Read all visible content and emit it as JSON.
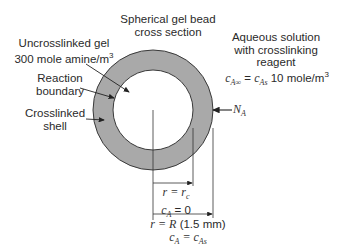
{
  "diagram": {
    "title_line1": "Spherical gel bead",
    "title_line2": "cross section",
    "left_labels": {
      "uncrosslinked_line1": "Uncrosslinked gel",
      "uncrosslinked_line2": "300 mole amine/m",
      "uncrosslinked_sup": "3",
      "reaction_line1": "Reaction",
      "reaction_line2": "boundary",
      "crosslinked_line1": "Crosslinked",
      "crosslinked_line2": "shell"
    },
    "right_labels": {
      "solution_line1": "Aqueous solution",
      "solution_line2": "with crosslinking",
      "solution_line3": "reagent",
      "conc_lhs": "c",
      "conc_lhs_sub": "A∞",
      "conc_eq": " = ",
      "conc_mid": "c",
      "conc_mid_sub": "As",
      "conc_value": " 10 mole/m",
      "conc_sup": "3",
      "flux": "N",
      "flux_sub": "A"
    },
    "bottom_labels": {
      "inner_r": "r = r",
      "inner_r_sub": "c",
      "inner_c": "c",
      "inner_c_sub": "A",
      "inner_c_val": " = 0",
      "outer_r": "r = ",
      "outer_R": "R",
      "outer_R_value": " (1.5 mm)",
      "outer_c": "c",
      "outer_c_sub": "A",
      "outer_c_eq": " = c",
      "outer_c_sub2": "As"
    },
    "colors": {
      "shell_fill": "#a9a9a9",
      "outline": "#3a3a3a",
      "core_fill": "#ffffff"
    }
  }
}
